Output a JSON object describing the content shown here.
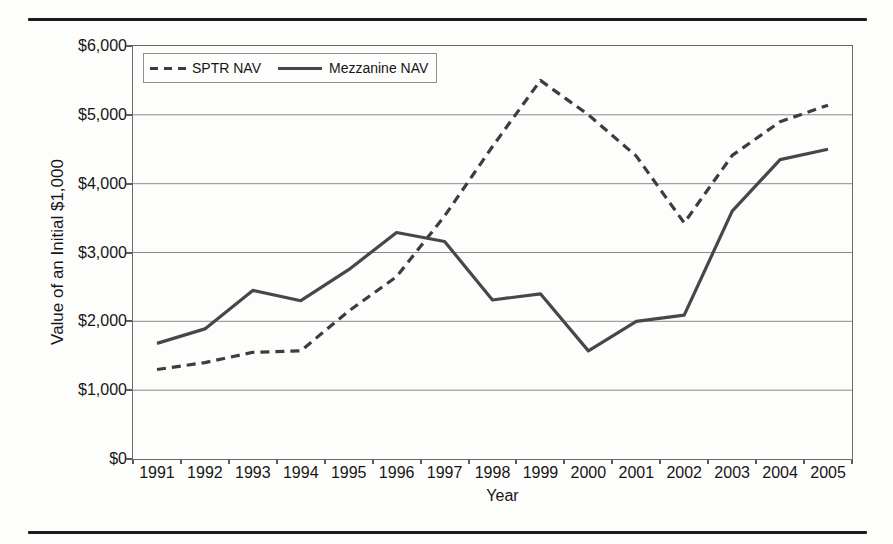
{
  "figure": {
    "rule_color": "#1c1c1c",
    "background": "#fdfdfc"
  },
  "chart_data": {
    "type": "line",
    "title": "",
    "xlabel": "Year",
    "ylabel": "Value of an Initial $1,000",
    "categories": [
      "1991",
      "1992",
      "1993",
      "1994",
      "1995",
      "1996",
      "1997",
      "1998",
      "1999",
      "2000",
      "2001",
      "2002",
      "2003",
      "2004",
      "2005"
    ],
    "ylim": [
      0,
      6000
    ],
    "y_tick_step": 1000,
    "y_ticks": [
      {
        "label": "$6,000",
        "value": 6000
      },
      {
        "label": "$5,000",
        "value": 5000
      },
      {
        "label": "$4,000",
        "value": 4000
      },
      {
        "label": "$3,000",
        "value": 3000
      },
      {
        "label": "$2,000",
        "value": 2000
      },
      {
        "label": "$1,000",
        "value": 1000
      },
      {
        "label": "$0",
        "value": 0
      }
    ],
    "grid": "horizontal",
    "grid_color": "#8a8a8a",
    "legend_position": "top-left-inside",
    "series": [
      {
        "name": "SPTR NAV",
        "line_style": "dashed",
        "color": "#3d3d3d",
        "values": [
          1300,
          1400,
          1550,
          1570,
          2150,
          2650,
          3530,
          4540,
          5500,
          5000,
          4400,
          3430,
          4410,
          4900,
          5140
        ]
      },
      {
        "name": "Mezzanine NAV",
        "line_style": "solid",
        "color": "#474747",
        "values": [
          1680,
          1890,
          2450,
          2300,
          2750,
          3290,
          3160,
          2310,
          2400,
          1570,
          2000,
          2090,
          3600,
          4350,
          4500
        ]
      }
    ]
  }
}
